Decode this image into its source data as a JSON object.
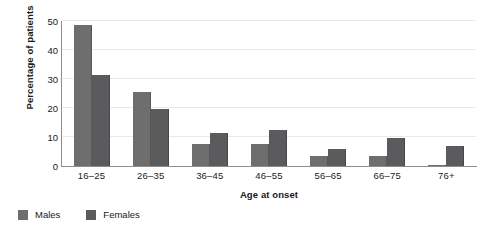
{
  "chart_data": {
    "type": "bar",
    "title": "",
    "xlabel": "Age at onset",
    "ylabel": "Percentage of patients",
    "categories": [
      "16–25",
      "26–35",
      "36–45",
      "46–55",
      "56–65",
      "66–75",
      "76+"
    ],
    "series": [
      {
        "name": "Males",
        "color": "#6e6e6e",
        "values": [
          48.5,
          25.5,
          7.5,
          7.5,
          3.5,
          3.5,
          0.5
        ]
      },
      {
        "name": "Females",
        "color": "#5b5b5d",
        "values": [
          31.5,
          19.5,
          11.5,
          12.5,
          6.0,
          9.5,
          7.0
        ]
      }
    ],
    "ylim": [
      0,
      50
    ],
    "yticks": [
      0,
      10,
      20,
      30,
      40,
      50
    ],
    "ytick_labels": [
      "0",
      "10",
      "20",
      "30",
      "40",
      "50"
    ],
    "grid": true,
    "grid_axis": "y",
    "legend_position": "bottom-left",
    "background_color": "#ffffff",
    "axis_color": "#8d8d8d",
    "grid_color": "#e9e9e9",
    "text_color": "#1a1a1a"
  }
}
